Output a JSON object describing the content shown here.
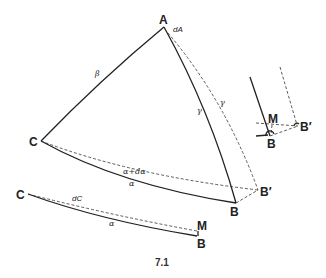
{
  "figure": {
    "caption": "7.1",
    "main_triangle": {
      "vertices": {
        "A": "A",
        "B": "B",
        "C": "C",
        "B_prime": "B′"
      },
      "sides": {
        "beta": "β",
        "gamma": "γ",
        "gamma_prime": "γ",
        "alpha": "α",
        "alpha_plus": "α+dα"
      },
      "angle_label": "dA"
    },
    "detail_inset": {
      "labels": {
        "M": "M",
        "B": "B",
        "B_prime": "B′"
      }
    },
    "lower_arc": {
      "labels": {
        "C": "C",
        "M": "M",
        "B": "B",
        "alpha": "α",
        "dC": "dC"
      }
    }
  }
}
